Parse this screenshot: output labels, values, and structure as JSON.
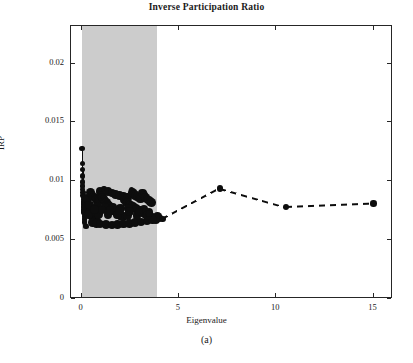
{
  "figure": {
    "title": "Inverse Participation Ratio",
    "subcaption": "(a)"
  },
  "chart_data": {
    "type": "scatter",
    "title": "Inverse Participation Ratio",
    "xlabel": "Eigenvalue",
    "ylabel": "IRP",
    "xlim": [
      -0.55,
      16.0
    ],
    "ylim": [
      0,
      0.0232
    ],
    "xticks": [
      0,
      5,
      10,
      15
    ],
    "xtick_labels": [
      "0",
      "5",
      "10",
      "15"
    ],
    "yticks": [
      0,
      0.005,
      0.01,
      0.015,
      0.02
    ],
    "ytick_labels": [
      "0",
      "0.005",
      "0.01",
      "0.015",
      "0.02"
    ],
    "grid": false,
    "legend": null,
    "shaded_region": {
      "orientation": "vertical",
      "x_start": 0.0,
      "x_end": 3.85,
      "color": "#cccccc",
      "description": "grey band covering the bulk of the eigenvalue spectrum"
    },
    "series": [
      {
        "name": "bulk eigenvector IRP scatter",
        "type": "scatter",
        "marker": "filled-circle",
        "color": "#0d0d0d",
        "points": [
          [
            0.02,
            0.0128
          ],
          [
            0.03,
            0.0115
          ],
          [
            0.04,
            0.011
          ],
          [
            0.05,
            0.01045
          ],
          [
            0.05,
            0.00995
          ],
          [
            0.06,
            0.0096
          ],
          [
            0.06,
            0.0093
          ],
          [
            0.07,
            0.00905
          ],
          [
            0.07,
            0.0088
          ],
          [
            0.08,
            0.00862
          ],
          [
            0.08,
            0.00845
          ],
          [
            0.09,
            0.0083
          ],
          [
            0.09,
            0.00815
          ],
          [
            0.1,
            0.008
          ],
          [
            0.1,
            0.00788
          ],
          [
            0.11,
            0.00775
          ],
          [
            0.11,
            0.00762
          ],
          [
            0.12,
            0.0075
          ],
          [
            0.12,
            0.0074
          ],
          [
            0.13,
            0.00728
          ],
          [
            0.13,
            0.00715
          ],
          [
            0.14,
            0.007
          ],
          [
            0.15,
            0.0068
          ],
          [
            0.16,
            0.00655
          ],
          [
            0.18,
            0.00628
          ],
          [
            0.22,
            0.00615
          ],
          [
            0.3,
            0.00855
          ],
          [
            0.34,
            0.008
          ],
          [
            0.38,
            0.00775
          ],
          [
            0.42,
            0.0076
          ],
          [
            0.46,
            0.00742
          ],
          [
            0.5,
            0.00728
          ],
          [
            0.54,
            0.00712
          ],
          [
            0.58,
            0.007
          ],
          [
            0.62,
            0.00688
          ],
          [
            0.66,
            0.00676
          ],
          [
            0.7,
            0.00668
          ],
          [
            0.74,
            0.0066
          ],
          [
            0.78,
            0.00652
          ],
          [
            0.82,
            0.00648
          ],
          [
            0.45,
            0.00905
          ],
          [
            0.52,
            0.00882
          ],
          [
            0.6,
            0.00868
          ],
          [
            0.68,
            0.00858
          ],
          [
            0.76,
            0.00848
          ],
          [
            0.84,
            0.0084
          ],
          [
            0.92,
            0.00834
          ],
          [
            0.95,
            0.00912
          ],
          [
            1.02,
            0.0088
          ],
          [
            1.08,
            0.00862
          ],
          [
            1.14,
            0.00845
          ],
          [
            1.2,
            0.0083
          ],
          [
            1.26,
            0.00818
          ],
          [
            1.32,
            0.00805
          ],
          [
            1.38,
            0.00795
          ],
          [
            1.44,
            0.00784
          ],
          [
            1.5,
            0.00775
          ],
          [
            1.56,
            0.00766
          ],
          [
            1.62,
            0.00758
          ],
          [
            1.68,
            0.0075
          ],
          [
            1.74,
            0.00742
          ],
          [
            1.8,
            0.00735
          ],
          [
            1.86,
            0.00728
          ],
          [
            1.92,
            0.0072
          ],
          [
            1.98,
            0.00712
          ],
          [
            2.04,
            0.00705
          ],
          [
            2.1,
            0.00698
          ],
          [
            1.15,
            0.00935
          ],
          [
            1.35,
            0.00915
          ],
          [
            1.55,
            0.009
          ],
          [
            1.75,
            0.0089
          ],
          [
            1.95,
            0.0088
          ],
          [
            2.15,
            0.00872
          ],
          [
            2.35,
            0.00865
          ],
          [
            2.2,
            0.0084
          ],
          [
            2.28,
            0.00828
          ],
          [
            2.36,
            0.00818
          ],
          [
            2.44,
            0.00808
          ],
          [
            2.52,
            0.00798
          ],
          [
            2.6,
            0.0079
          ],
          [
            2.68,
            0.00782
          ],
          [
            2.76,
            0.00774
          ],
          [
            2.84,
            0.00766
          ],
          [
            2.92,
            0.00758
          ],
          [
            3.0,
            0.0075
          ],
          [
            3.08,
            0.00742
          ],
          [
            3.16,
            0.00735
          ],
          [
            3.24,
            0.00728
          ],
          [
            3.32,
            0.0072
          ],
          [
            3.4,
            0.00712
          ],
          [
            2.55,
            0.00932
          ],
          [
            2.62,
            0.00905
          ],
          [
            2.7,
            0.00888
          ],
          [
            2.78,
            0.00876
          ],
          [
            2.86,
            0.00866
          ],
          [
            2.94,
            0.00858
          ],
          [
            3.02,
            0.0085
          ],
          [
            3.12,
            0.009
          ],
          [
            3.2,
            0.00878
          ],
          [
            3.28,
            0.00862
          ],
          [
            3.36,
            0.0085
          ],
          [
            3.44,
            0.0084
          ],
          [
            3.52,
            0.0083
          ],
          [
            3.6,
            0.0082
          ],
          [
            3.5,
            0.00705
          ],
          [
            3.58,
            0.00698
          ],
          [
            3.66,
            0.0069
          ],
          [
            3.74,
            0.00684
          ],
          [
            3.82,
            0.00678
          ],
          [
            3.9,
            0.007
          ],
          [
            3.98,
            0.0069
          ],
          [
            0.55,
            0.0065
          ],
          [
            0.75,
            0.0064
          ],
          [
            0.95,
            0.00636
          ],
          [
            1.25,
            0.00632
          ],
          [
            1.55,
            0.0063
          ],
          [
            1.85,
            0.00632
          ],
          [
            2.15,
            0.00636
          ],
          [
            2.45,
            0.00642
          ],
          [
            2.75,
            0.00648
          ],
          [
            3.05,
            0.00655
          ],
          [
            3.35,
            0.00662
          ],
          [
            3.65,
            0.0067
          ],
          [
            0.4,
            0.008
          ],
          [
            0.8,
            0.0079
          ],
          [
            1.2,
            0.00782
          ],
          [
            1.6,
            0.00778
          ],
          [
            2.0,
            0.00772
          ],
          [
            2.4,
            0.00768
          ],
          [
            2.8,
            0.00764
          ],
          [
            3.2,
            0.0076
          ],
          [
            0.35,
            0.0072
          ],
          [
            0.85,
            0.00718
          ],
          [
            1.35,
            0.00716
          ],
          [
            1.85,
            0.00714
          ],
          [
            2.35,
            0.00712
          ],
          [
            2.85,
            0.0071
          ],
          [
            3.35,
            0.00708
          ],
          [
            0.65,
            0.0076
          ],
          [
            1.05,
            0.00756
          ],
          [
            1.45,
            0.00752
          ],
          [
            1.95,
            0.00748
          ],
          [
            2.45,
            0.00744
          ],
          [
            2.95,
            0.0074
          ],
          [
            3.45,
            0.00736
          ]
        ],
        "note": "dense overlapping cluster confined to the shaded bulk region 0 < eigenvalue < 3.9, IRP roughly 0.006-0.0128"
      },
      {
        "name": "outlier eigenvector IRP (dashed trend)",
        "type": "line",
        "linestyle": "dashed",
        "marker": "filled-circle",
        "color": "#0d0d0d",
        "x": [
          3.45,
          4.15,
          7.1,
          10.5,
          15.0
        ],
        "y": [
          0.00725,
          0.0068,
          0.0094,
          0.0078,
          0.0081
        ]
      }
    ]
  }
}
